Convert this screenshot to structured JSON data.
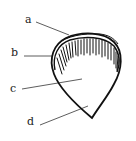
{
  "diagram": {
    "labels": [
      {
        "id": "a",
        "text": "a",
        "x": 25,
        "y": 14
      },
      {
        "id": "b",
        "text": "b",
        "x": 11,
        "y": 47
      },
      {
        "id": "c",
        "text": "c",
        "x": 10,
        "y": 83
      },
      {
        "id": "d",
        "text": "d",
        "x": 27,
        "y": 116
      }
    ],
    "stroke_color": "#111111"
  }
}
